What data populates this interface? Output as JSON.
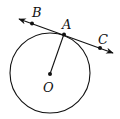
{
  "diagram": {
    "type": "geometry",
    "labels": {
      "B": "B",
      "A": "A",
      "C": "C",
      "O": "O"
    },
    "colors": {
      "stroke": "#111111",
      "background": "#ffffff"
    },
    "elements": {
      "circle": {
        "center": "O",
        "passes_through": "A"
      },
      "tangent_line": {
        "through": [
          "B",
          "A",
          "C"
        ],
        "arrows": "both ends"
      },
      "radius": {
        "from": "O",
        "to": "A"
      }
    }
  }
}
